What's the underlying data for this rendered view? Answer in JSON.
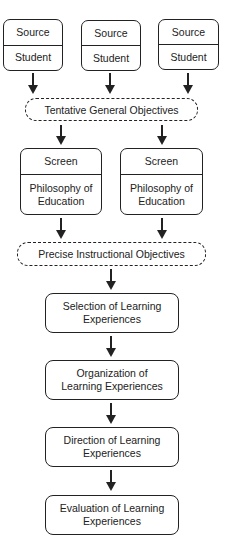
{
  "diagram": {
    "sources": [
      {
        "top": "Source",
        "bottom": "Student"
      },
      {
        "top": "Source",
        "bottom": "Student"
      },
      {
        "top": "Source",
        "bottom": "Student"
      }
    ],
    "tentative": "Tentative General Objectives",
    "screens": [
      {
        "top": "Screen",
        "bottom": "Philosophy of Education"
      },
      {
        "top": "Screen",
        "bottom": "Philosophy of Education"
      }
    ],
    "precise": "Precise Instructional Objectives",
    "steps": [
      "Selection of Learning Experiences",
      "Organization of Learning Experiences",
      "Direction of Learning Experiences",
      "Evaluation of Learning Experiences"
    ]
  }
}
